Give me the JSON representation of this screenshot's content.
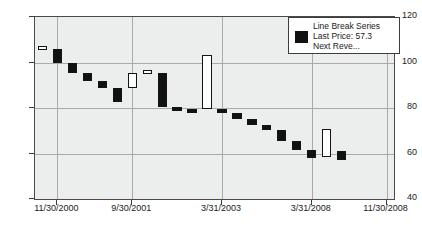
{
  "chart_data": {
    "type": "bar",
    "subtype": "line-break",
    "title": "",
    "xlabel": "",
    "ylabel": "",
    "ylim": [
      40,
      120
    ],
    "y_ticks": [
      40,
      60,
      80,
      100,
      120
    ],
    "grid": true,
    "x_tick_labels": [
      "11/30/2000",
      "9/30/2001",
      "3/31/2003",
      "3/31/2008",
      "11/30/2008"
    ],
    "x_tick_positions": [
      1,
      6,
      12,
      18,
      23
    ],
    "legend": {
      "position": "top-right",
      "swatch_color": "#111111",
      "lines": [
        "Line Break Series",
        "Last Price: 57.3",
        "Next Reve..."
      ]
    },
    "colors": {
      "down": "#111111",
      "up": "#ffffff",
      "plot_background": "#eceded",
      "grid": "#a9abab",
      "axis": "#3d3d3d"
    },
    "series_name": "Line Break Series",
    "last_price": 57.3,
    "bar_count": 24,
    "bars": [
      {
        "index": 0,
        "open": 106.0,
        "close": 107.3,
        "direction": "up"
      },
      {
        "index": 1,
        "open": 106.0,
        "close": 99.8,
        "direction": "down"
      },
      {
        "index": 2,
        "open": 99.8,
        "close": 95.6,
        "direction": "down"
      },
      {
        "index": 3,
        "open": 95.6,
        "close": 91.7,
        "direction": "down"
      },
      {
        "index": 4,
        "open": 91.7,
        "close": 88.8,
        "direction": "down"
      },
      {
        "index": 5,
        "open": 88.8,
        "close": 82.8,
        "direction": "down"
      },
      {
        "index": 6,
        "open": 88.8,
        "close": 95.2,
        "direction": "up"
      },
      {
        "index": 7,
        "open": 95.2,
        "close": 96.6,
        "direction": "up"
      },
      {
        "index": 8,
        "open": 95.5,
        "close": 80.4,
        "direction": "down"
      },
      {
        "index": 9,
        "open": 80.4,
        "close": 79.7,
        "direction": "down"
      },
      {
        "index": 10,
        "open": 79.7,
        "close": 78.2,
        "direction": "down"
      },
      {
        "index": 11,
        "open": 79.5,
        "close": 103.5,
        "direction": "up"
      },
      {
        "index": 12,
        "open": 79.5,
        "close": 78.0,
        "direction": "down"
      },
      {
        "index": 13,
        "open": 78.0,
        "close": 75.2,
        "direction": "down"
      },
      {
        "index": 14,
        "open": 75.2,
        "close": 72.4,
        "direction": "down"
      },
      {
        "index": 15,
        "open": 72.4,
        "close": 70.2,
        "direction": "down"
      },
      {
        "index": 16,
        "open": 70.2,
        "close": 65.5,
        "direction": "down"
      },
      {
        "index": 17,
        "open": 65.5,
        "close": 61.4,
        "direction": "down"
      },
      {
        "index": 18,
        "open": 61.4,
        "close": 58.2,
        "direction": "down"
      },
      {
        "index": 19,
        "open": 58.6,
        "close": 70.9,
        "direction": "up"
      },
      {
        "index": 20,
        "open": 61.0,
        "close": 57.3,
        "direction": "down"
      }
    ]
  }
}
